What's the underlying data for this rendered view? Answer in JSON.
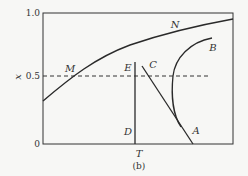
{
  "figure": {
    "caption": "(b)",
    "y_axis_label": "x",
    "x_axis_label": "T",
    "y_ticks": [
      "1.0",
      "0.5",
      "0"
    ],
    "dashed_level_label": "0.5",
    "curve_labels": {
      "M": "M",
      "N": "N",
      "B": "B",
      "C": "C",
      "E": "E",
      "D": "D",
      "A": "A"
    },
    "colors": {
      "line": "#2a2a2a",
      "background": "#f7f7f5"
    }
  }
}
